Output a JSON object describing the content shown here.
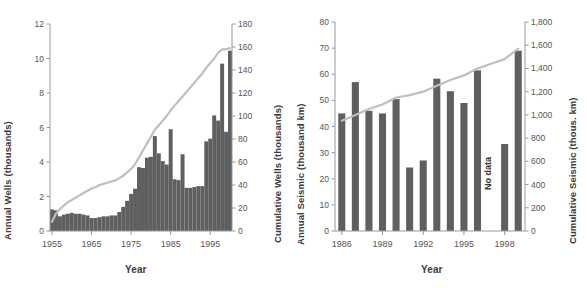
{
  "figure": {
    "background_color": "#ffffff",
    "bar_color": "#5f5f5f",
    "line_color": "#bfbfbf",
    "axis_color": "#9a9a9a",
    "text_color": "#4a4a4a"
  },
  "chart_data": [
    {
      "type": "bar",
      "id": "wells",
      "title": "",
      "xlabel": "Year",
      "ylabel": "Annual Wells (thousands)",
      "y2label": "Cumulative Wells (thousands)",
      "x": [
        1955,
        1956,
        1957,
        1958,
        1959,
        1960,
        1961,
        1962,
        1963,
        1964,
        1965,
        1966,
        1967,
        1968,
        1969,
        1970,
        1971,
        1972,
        1973,
        1974,
        1975,
        1976,
        1977,
        1978,
        1979,
        1980,
        1981,
        1982,
        1983,
        1984,
        1985,
        1986,
        1987,
        1988,
        1989,
        1990,
        1991,
        1992,
        1993,
        1994,
        1995,
        1996,
        1997,
        1998,
        1999,
        2000
      ],
      "xtick_labels": [
        "1955",
        "1965",
        "1975",
        "1985",
        "1995"
      ],
      "xticks": [
        1955,
        1965,
        1975,
        1985,
        1995
      ],
      "ylim": [
        0,
        12
      ],
      "yticks": [
        0,
        2,
        4,
        6,
        8,
        10,
        12
      ],
      "ytick_labels": [
        "0",
        "2",
        "4",
        "6",
        "8",
        "10",
        "12"
      ],
      "y2lim": [
        0,
        180
      ],
      "y2ticks": [
        0,
        20,
        40,
        60,
        80,
        100,
        120,
        140,
        160,
        180
      ],
      "y2tick_labels": [
        "0",
        "20",
        "40",
        "60",
        "80",
        "100",
        "120",
        "140",
        "160",
        "180"
      ],
      "grid": false,
      "series": [
        {
          "name": "Annual Wells",
          "kind": "bar",
          "axis": "left",
          "values": [
            1.25,
            1.2,
            0.85,
            0.95,
            1.0,
            1.05,
            1.0,
            1.0,
            0.95,
            0.9,
            0.75,
            0.75,
            0.8,
            0.85,
            0.85,
            0.9,
            0.9,
            1.1,
            1.4,
            1.75,
            2.15,
            2.45,
            3.7,
            3.65,
            4.25,
            4.3,
            5.5,
            4.5,
            4.05,
            3.85,
            5.9,
            3.0,
            2.95,
            4.45,
            2.5,
            2.5,
            2.55,
            2.6,
            2.6,
            5.2,
            5.35,
            6.7,
            6.4,
            9.7,
            5.75,
            10.45
          ]
        },
        {
          "name": "Cumulative Wells",
          "kind": "line",
          "axis": "right",
          "values": [
            8,
            15,
            19,
            22,
            25,
            27,
            29,
            31,
            33,
            35,
            37,
            38,
            40,
            41,
            42,
            43,
            44,
            46,
            48,
            51,
            54,
            58,
            64,
            70,
            76,
            82,
            88,
            92,
            96,
            100,
            105,
            109,
            113,
            117,
            121,
            125,
            129,
            133,
            137,
            142,
            146,
            150,
            155,
            158,
            158,
            159
          ]
        }
      ]
    },
    {
      "type": "bar",
      "id": "seismic",
      "title": "",
      "xlabel": "Year",
      "ylabel": "Annual Seismic (thousand km)",
      "y2label": "Cumulative Seismic (thous. km)",
      "x": [
        1986,
        1987,
        1988,
        1989,
        1990,
        1991,
        1992,
        1993,
        1994,
        1995,
        1996,
        1997,
        1998,
        1999
      ],
      "xtick_labels": [
        "1986",
        "1989",
        "1992",
        "1995",
        "1998"
      ],
      "xticks": [
        1986,
        1989,
        1992,
        1995,
        1998
      ],
      "ylim": [
        0,
        80
      ],
      "yticks": [
        0,
        10,
        20,
        30,
        40,
        50,
        60,
        70,
        80
      ],
      "ytick_labels": [
        "0",
        "10",
        "20",
        "30",
        "40",
        "50",
        "60",
        "70",
        "80"
      ],
      "y2lim": [
        0,
        1800
      ],
      "y2ticks": [
        0,
        200,
        400,
        600,
        800,
        1000,
        1200,
        1400,
        1600,
        1800
      ],
      "y2tick_labels": [
        "0",
        "200",
        "400",
        "600",
        "800",
        "1,000",
        "1,200",
        "1,400",
        "1,600",
        "1,800"
      ],
      "grid": false,
      "annotations": [
        {
          "text": "No data",
          "x": 1997,
          "y": 22
        }
      ],
      "series": [
        {
          "name": "Annual Seismic",
          "kind": "bar",
          "axis": "left",
          "values": [
            45.0,
            57.0,
            46.0,
            45.0,
            50.5,
            24.3,
            27.0,
            58.3,
            53.5,
            49.0,
            61.5,
            null,
            33.3,
            69.0
          ]
        },
        {
          "name": "Cumulative Seismic",
          "kind": "line",
          "axis": "right",
          "values": [
            950,
            1000,
            1050,
            1090,
            1150,
            1170,
            1200,
            1250,
            1300,
            1340,
            1400,
            1440,
            1480,
            1570
          ]
        }
      ]
    }
  ]
}
